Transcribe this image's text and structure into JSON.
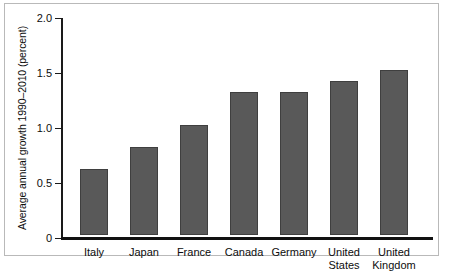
{
  "chart_data": {
    "type": "bar",
    "title": "",
    "xlabel": "",
    "ylabel": "Average annual growth 1990–2010 (percent)",
    "categories": [
      "Italy",
      "Japan",
      "France",
      "Canada",
      "Germany",
      "United States",
      "United Kingdom"
    ],
    "category_lines": [
      [
        "Italy"
      ],
      [
        "Japan"
      ],
      [
        "France"
      ],
      [
        "Canada"
      ],
      [
        "Germany"
      ],
      [
        "United",
        "States"
      ],
      [
        "United",
        "Kingdom"
      ]
    ],
    "values": [
      0.6,
      0.8,
      1.0,
      1.3,
      1.3,
      1.4,
      1.5
    ],
    "ylim": [
      0,
      2.0
    ],
    "yticks": [
      0,
      0.5,
      1.0,
      1.5,
      2.0
    ],
    "ytick_labels": [
      "0",
      "0.5",
      "1.0",
      "1.5",
      "2.0"
    ],
    "grid": false,
    "legend": false,
    "bar_color": "#595959",
    "bar_edge_color": "#3f3f3f",
    "axis_color": "#111111",
    "frame_color": "#b9b9b9"
  }
}
